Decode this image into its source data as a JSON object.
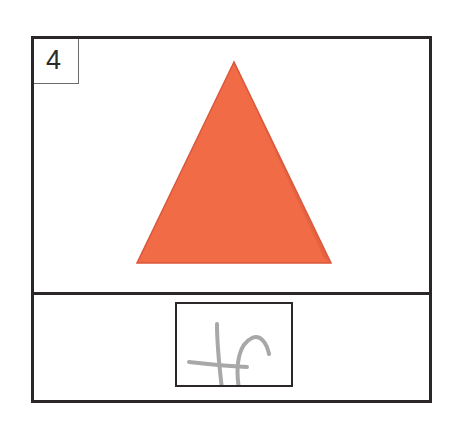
{
  "card": {
    "number": "4",
    "shape": {
      "type": "triangle",
      "fill": "#f26b47",
      "edge": "#d9573a"
    },
    "answer": {
      "handwriting": "tr",
      "stroke": "#a8a8a8"
    },
    "border_color": "#2b2627"
  }
}
